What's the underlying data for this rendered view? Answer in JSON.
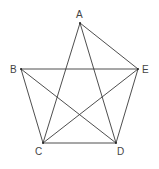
{
  "diagram": {
    "points": [
      {
        "id": "A",
        "label": "A",
        "x": 80,
        "y": 23,
        "lx": 76,
        "ly": 18
      },
      {
        "id": "B",
        "label": "B",
        "x": 21,
        "y": 69,
        "lx": 10,
        "ly": 73
      },
      {
        "id": "E",
        "label": "E",
        "x": 138,
        "y": 69,
        "lx": 142,
        "ly": 73
      },
      {
        "id": "C",
        "label": "C",
        "x": 43,
        "y": 143,
        "lx": 35,
        "ly": 155
      },
      {
        "id": "D",
        "label": "D",
        "x": 116,
        "y": 143,
        "lx": 117,
        "ly": 155
      }
    ],
    "edges": [
      [
        "A",
        "C"
      ],
      [
        "A",
        "D"
      ],
      [
        "A",
        "E"
      ],
      [
        "B",
        "E"
      ],
      [
        "B",
        "C"
      ],
      [
        "B",
        "D"
      ],
      [
        "C",
        "E"
      ],
      [
        "C",
        "D"
      ],
      [
        "D",
        "E"
      ]
    ]
  }
}
